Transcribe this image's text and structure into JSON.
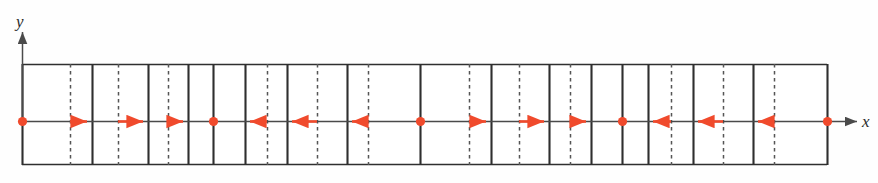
{
  "figure": {
    "axes": {
      "x_label": "x",
      "y_label": "y",
      "x_axis_y": 121,
      "x_axis_start": 22,
      "x_axis_end": 857,
      "y_axis_x": 22,
      "y_axis_top": 32,
      "y_axis_bottom": 121
    },
    "strip": {
      "left": 22,
      "right": 827,
      "top": 64,
      "bottom": 165,
      "outline_color": "#3a3a3a",
      "fill_color": "#ffffff"
    },
    "colors": {
      "marker": "#f04a2c",
      "arrow": "#f04a2c",
      "line_solid": "#2f2f2f",
      "line_dashed": "#555555",
      "axis": "#4a4a4a"
    },
    "solid_lines_x": [
      22,
      92,
      148,
      188,
      213,
      245,
      287,
      347,
      420,
      491,
      549,
      591,
      622,
      648,
      693,
      753,
      827
    ],
    "dashed_lines_x": [
      70,
      118,
      168,
      267,
      317,
      368,
      469,
      519,
      570,
      671,
      723,
      774
    ],
    "markers_x": [
      22,
      213,
      420,
      622,
      827
    ],
    "arrows": [
      {
        "from": 70,
        "to": 92,
        "direction": "right"
      },
      {
        "from": 118,
        "to": 148,
        "direction": "right"
      },
      {
        "from": 168,
        "to": 188,
        "direction": "right"
      },
      {
        "from": 267,
        "to": 245,
        "direction": "left"
      },
      {
        "from": 317,
        "to": 287,
        "direction": "left"
      },
      {
        "from": 368,
        "to": 347,
        "direction": "left"
      },
      {
        "from": 469,
        "to": 491,
        "direction": "right"
      },
      {
        "from": 519,
        "to": 549,
        "direction": "right"
      },
      {
        "from": 570,
        "to": 591,
        "direction": "right"
      },
      {
        "from": 671,
        "to": 648,
        "direction": "left"
      },
      {
        "from": 723,
        "to": 693,
        "direction": "left"
      },
      {
        "from": 774,
        "to": 753,
        "direction": "left"
      }
    ]
  },
  "chart_data": {
    "type": "scatter",
    "title": "",
    "xlabel": "x",
    "ylabel": "y",
    "x": [
      22,
      213,
      420,
      622,
      827
    ],
    "values": [
      0,
      0,
      0,
      0,
      0
    ],
    "series": [
      {
        "name": "nodal markers",
        "x": [
          22,
          213,
          420,
          622,
          827
        ],
        "y": [
          0,
          0,
          0,
          0,
          0
        ]
      },
      {
        "name": "displacement arrows",
        "x": [
          70,
          118,
          168,
          267,
          317,
          368,
          469,
          519,
          570,
          671,
          723,
          774
        ],
        "y": [
          0,
          0,
          0,
          0,
          0,
          0,
          0,
          0,
          0,
          0,
          0,
          0
        ],
        "dx": [
          22,
          30,
          20,
          -22,
          -30,
          -21,
          22,
          30,
          21,
          -23,
          -30,
          -21
        ]
      }
    ],
    "grid": true,
    "legend": "none",
    "xlim": [
      22,
      857
    ],
    "ylim": [
      -1,
      1
    ]
  }
}
